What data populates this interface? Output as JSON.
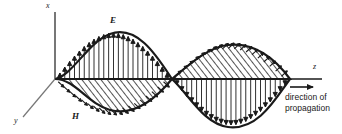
{
  "figure": {
    "background": "#ffffff",
    "ink": "#1a1a1a"
  },
  "axes": {
    "x": {
      "label": "x",
      "orientation": "vertical-up",
      "x_px": 55,
      "top_px": 10,
      "bottom_px": 79
    },
    "y": {
      "label": "y",
      "orientation": "diagonal-down-left",
      "from_px": [
        55,
        79
      ],
      "to_px": [
        22,
        118
      ]
    },
    "z": {
      "label": "z",
      "orientation": "horizontal-right",
      "y_px": 79,
      "left_px": 55,
      "right_px": 325
    }
  },
  "fields": {
    "electric": {
      "label": "E",
      "description": "vertical arrows, in the x-z plane",
      "lobes": [
        {
          "sign": "positive",
          "direction": "up",
          "start_px": 55,
          "end_px": 172,
          "peak_px": 110,
          "amplitude_px": 46
        },
        {
          "sign": "negative",
          "direction": "down",
          "start_px": 172,
          "end_px": 290,
          "peak_px": 228,
          "amplitude_px": 46
        }
      ],
      "arrow_count": 24
    },
    "magnetic": {
      "label": "H",
      "description": "hatched lobes, in the y-z plane, 90 degrees to E",
      "lobes": [
        {
          "sign": "negative",
          "direction": "down",
          "start_px": 55,
          "end_px": 172,
          "peak_px": 110,
          "amplitude_px": 33
        },
        {
          "sign": "positive",
          "direction": "up",
          "start_px": 172,
          "end_px": 290,
          "peak_px": 228,
          "amplitude_px": 33
        }
      ],
      "hatch": "diagonal"
    }
  },
  "annotation": {
    "propagation_line1": "direction of",
    "propagation_line2": "propagation",
    "propagation_arrow": "arrow-right-icon"
  },
  "chart_data": {
    "type": "line",
    "xlabel": "z",
    "ylabel": "x",
    "series": [
      {
        "name": "E",
        "phase_deg": 0,
        "amplitude": 1.0,
        "plane": "x-z",
        "x": [
          0,
          0.125,
          0.25,
          0.375,
          0.5,
          0.625,
          0.75,
          0.875,
          1.0
        ],
        "values": [
          0,
          0.71,
          1.0,
          0.71,
          0,
          -0.71,
          -1.0,
          -0.71,
          0
        ]
      },
      {
        "name": "H",
        "phase_deg": 0,
        "amplitude": 0.72,
        "plane": "y-z",
        "x": [
          0,
          0.125,
          0.25,
          0.375,
          0.5,
          0.625,
          0.75,
          0.875,
          1.0
        ],
        "values": [
          0,
          -0.51,
          -0.72,
          -0.51,
          0,
          0.51,
          0.72,
          0.51,
          0
        ]
      }
    ],
    "legend": [
      "E",
      "H"
    ],
    "grid": false
  }
}
